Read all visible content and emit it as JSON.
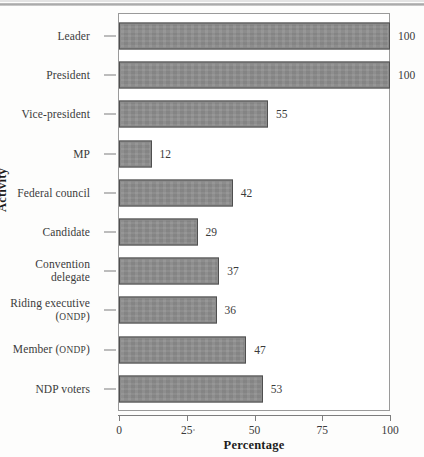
{
  "chart_data": {
    "type": "bar",
    "orientation": "horizontal",
    "title": "",
    "xlabel": "Percentage",
    "ylabel": "Activity",
    "xlim": [
      0,
      100
    ],
    "xticks": [
      0,
      25,
      50,
      75,
      100
    ],
    "grid": false,
    "legend": null,
    "bar_color": "#8c8c8c",
    "bar_edge_color": "#4f4f4f",
    "categories": [
      "Leader",
      "President",
      "Vice-president",
      "MP",
      "Federal council",
      "Candidate",
      "Convention delegate",
      "Riding executive (ONDP)",
      "Member (ONDP)",
      "NDP voters"
    ],
    "values": [
      100,
      100,
      55,
      12,
      42,
      29,
      37,
      36,
      47,
      53
    ],
    "data_labels": [
      "100",
      "100",
      "55",
      "12",
      "42",
      "29",
      "37",
      "36",
      "47",
      "53"
    ]
  },
  "rows": [
    {
      "label_line1": "Leader",
      "label_line2": "",
      "smallcaps1": "",
      "smallcaps2": "",
      "value": 100,
      "value_label": "100"
    },
    {
      "label_line1": "President",
      "label_line2": "",
      "smallcaps1": "",
      "smallcaps2": "",
      "value": 100,
      "value_label": "100"
    },
    {
      "label_line1": "Vice-president",
      "label_line2": "",
      "smallcaps1": "",
      "smallcaps2": "",
      "value": 55,
      "value_label": "55"
    },
    {
      "label_line1": "MP",
      "label_line2": "",
      "smallcaps1": "",
      "smallcaps2": "",
      "value": 12,
      "value_label": "12"
    },
    {
      "label_line1": "Federal council",
      "label_line2": "",
      "smallcaps1": "",
      "smallcaps2": "",
      "value": 42,
      "value_label": "42"
    },
    {
      "label_line1": "Candidate",
      "label_line2": "",
      "smallcaps1": "",
      "smallcaps2": "",
      "value": 29,
      "value_label": "29"
    },
    {
      "label_line1": "Convention",
      "label_line2": "delegate",
      "smallcaps1": "",
      "smallcaps2": "",
      "value": 37,
      "value_label": "37"
    },
    {
      "label_line1": "Riding executive",
      "label_line2": "",
      "smallcaps1": "",
      "smallcaps2": "ONDP",
      "value": 36,
      "value_label": "36"
    },
    {
      "label_line1": "Member (",
      "label_line2": "",
      "smallcaps1": "ONDP",
      "smallcaps2": "",
      "value": 47,
      "value_label": "47"
    },
    {
      "label_line1": "NDP voters",
      "label_line2": "",
      "smallcaps1": "",
      "smallcaps2": "",
      "value": 53,
      "value_label": "53"
    }
  ],
  "axis": {
    "x_title": "Percentage",
    "y_title": "Activity",
    "x_tick_labels": [
      "0",
      "25",
      "50",
      "75",
      "100"
    ]
  }
}
